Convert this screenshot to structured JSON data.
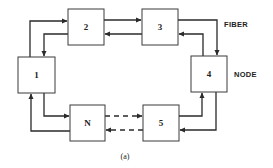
{
  "diagram": {
    "type": "ring-network",
    "nodes": [
      {
        "id": "1",
        "label": "1"
      },
      {
        "id": "2",
        "label": "2"
      },
      {
        "id": "3",
        "label": "3"
      },
      {
        "id": "4",
        "label": "4"
      },
      {
        "id": "5",
        "label": "5"
      },
      {
        "id": "N",
        "label": "N"
      }
    ],
    "labels": {
      "fiber": "FIBER",
      "node": "NODE"
    },
    "caption": "(a)",
    "connections": [
      {
        "from": "1",
        "to": "2",
        "style": "solid"
      },
      {
        "from": "2",
        "to": "1",
        "style": "solid"
      },
      {
        "from": "2",
        "to": "3",
        "style": "solid"
      },
      {
        "from": "3",
        "to": "2",
        "style": "solid"
      },
      {
        "from": "3",
        "to": "4",
        "style": "solid"
      },
      {
        "from": "4",
        "to": "3",
        "style": "solid"
      },
      {
        "from": "5",
        "to": "4",
        "style": "solid"
      },
      {
        "from": "4",
        "to": "5",
        "style": "solid"
      },
      {
        "from": "N",
        "to": "5",
        "style": "dashed"
      },
      {
        "from": "5",
        "to": "N",
        "style": "dashed"
      },
      {
        "from": "1",
        "to": "N",
        "style": "solid"
      },
      {
        "from": "N",
        "to": "1",
        "style": "solid"
      }
    ]
  }
}
